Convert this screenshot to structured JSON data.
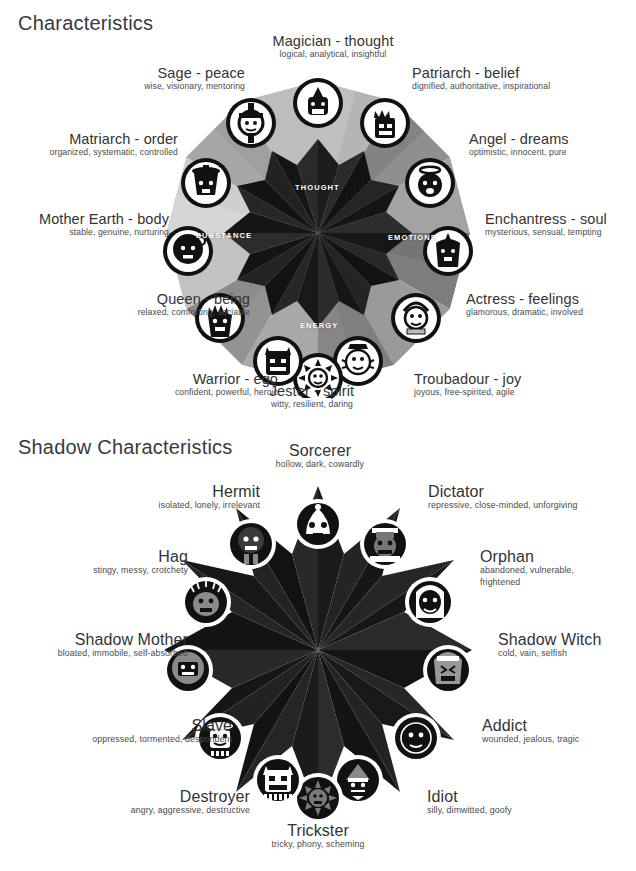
{
  "sections": {
    "light": {
      "title": "Characteristics",
      "center_labels": [
        {
          "id": "thought",
          "text": "THOUGHT"
        },
        {
          "id": "emotions",
          "text": "EMOTIONS"
        },
        {
          "id": "energy",
          "text": "ENERGY"
        },
        {
          "id": "substance",
          "text": "SUBSTANCE"
        }
      ],
      "archetypes": [
        {
          "name": "Magician - thought",
          "desc": "logical, analytical, insightful",
          "icon": "magician-icon"
        },
        {
          "name": "Patriarch - belief",
          "desc": "dignified, authoritative, inspirational",
          "icon": "patriarch-icon"
        },
        {
          "name": "Angel - dreams",
          "desc": "optimistic, innocent, pure",
          "icon": "angel-icon"
        },
        {
          "name": "Enchantress - soul",
          "desc": "mysterious, sensual, tempting",
          "icon": "enchantress-icon"
        },
        {
          "name": "Actress - feelings",
          "desc": "glamorous, dramatic, involved",
          "icon": "actress-icon"
        },
        {
          "name": "Troubadour - joy",
          "desc": "joyous, free-spirited, agile",
          "icon": "troubadour-icon"
        },
        {
          "name": "Jester - spirit",
          "desc": "witty, resilient, daring",
          "icon": "jester-icon"
        },
        {
          "name": "Warrior - ego",
          "desc": "confident, powerful, heroic",
          "icon": "warrior-icon"
        },
        {
          "name": "Queen - being",
          "desc": "relaxed, comforting, sociable",
          "icon": "queen-icon"
        },
        {
          "name": "Mother Earth - body",
          "desc": "stable, genuine, nurturing",
          "icon": "mother-earth-icon"
        },
        {
          "name": "Matriarch - order",
          "desc": "organized, systematic, controlled",
          "icon": "matriarch-icon"
        },
        {
          "name": "Sage - peace",
          "desc": "wise, visionary, mentoring",
          "icon": "sage-icon"
        }
      ]
    },
    "shadow": {
      "title": "Shadow Characteristics",
      "archetypes": [
        {
          "name": "Sorcerer",
          "desc": "hollow, dark, cowardly",
          "icon": "sorcerer-icon"
        },
        {
          "name": "Dictator",
          "desc": "repressive, close-minded, unforgiving",
          "icon": "dictator-icon"
        },
        {
          "name": "Orphan",
          "desc": "abandoned, vulnerable, frightened",
          "icon": "orphan-icon"
        },
        {
          "name": "Shadow Witch",
          "desc": "cold, vain, selfish",
          "icon": "shadow-witch-icon"
        },
        {
          "name": "Addict",
          "desc": "wounded, jealous, tragic",
          "icon": "addict-icon"
        },
        {
          "name": "Idiot",
          "desc": "silly, dimwitted, goofy",
          "icon": "idiot-icon"
        },
        {
          "name": "Trickster",
          "desc": "tricky, phony, scheming",
          "icon": "trickster-icon"
        },
        {
          "name": "Destroyer",
          "desc": "angry, aggressive, destructive",
          "icon": "destroyer-icon"
        },
        {
          "name": "Slave",
          "desc": "oppressed, tormented, despondent",
          "icon": "slave-icon"
        },
        {
          "name": "Shadow Mother",
          "desc": "bloated, immobile, self-absorbed",
          "icon": "shadow-mother-icon"
        },
        {
          "name": "Hag",
          "desc": "stingy, messy, crotchety",
          "icon": "hag-icon"
        },
        {
          "name": "Hermit",
          "desc": "isolated, lonely, irrelevant",
          "icon": "hermit-icon"
        }
      ]
    }
  },
  "colors": {
    "background": "#ffffff",
    "text": "#333333",
    "subtext": "#4a4a4a",
    "light_wheel_tones": [
      "#d9d9d9",
      "#c6c6c6",
      "#b2b2b2",
      "#9d9d9d",
      "#8a8a8a",
      "#777777",
      "#636363",
      "#4f4f4f"
    ],
    "light_wheel_core": "#1a1a1a",
    "shadow_wheel_tones": [
      "#1d1d1d",
      "#232323",
      "#2b2b2b",
      "#333333",
      "#3a3a3a",
      "#141414"
    ],
    "icon_ring_light": "#111111",
    "icon_ring_shadow": "#ffffff"
  }
}
